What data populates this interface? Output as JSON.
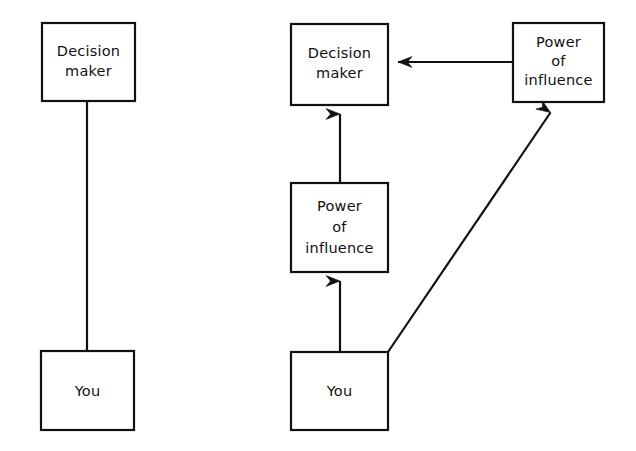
{
  "figure": {
    "background_color": "#ffffff",
    "line_color": "#111111",
    "panels": [
      {
        "id": "left-panel",
        "name": "direct-relationship-panel",
        "nodes": [
          {
            "id": "left-decision-maker",
            "label": "Decision\nmaker",
            "line1": "Decision",
            "line2": "maker",
            "x": 42,
            "y": 23,
            "w": 93,
            "h": 78
          },
          {
            "id": "left-you",
            "label": "You",
            "line1": "You",
            "x": 41,
            "y": 351,
            "w": 93,
            "h": 79
          }
        ],
        "connectors": [
          {
            "id": "left-link",
            "from": "left-decision-maker",
            "to": "left-you",
            "style": "plain-line",
            "arrowheads": 0,
            "x1": 87,
            "y1": 101,
            "x2": 87,
            "y2": 351
          }
        ]
      },
      {
        "id": "right-panel",
        "name": "power-of-influence-panel",
        "nodes": [
          {
            "id": "right-decision-maker",
            "label": "Decision\nmaker",
            "line1": "Decision",
            "line2": "maker",
            "x": 291,
            "y": 24,
            "w": 97,
            "h": 81
          },
          {
            "id": "right-power-top",
            "label": "Power\nof\ninfluence",
            "line1": "Power",
            "line2": "of",
            "line3": "influence",
            "x": 513,
            "y": 23,
            "w": 91,
            "h": 79
          },
          {
            "id": "right-power-middle",
            "label": "Power\nof\ninfluence",
            "line1": "Power",
            "line2": "of",
            "line3": "influence",
            "x": 291,
            "y": 183,
            "w": 97,
            "h": 89
          },
          {
            "id": "right-you",
            "label": "You",
            "line1": "You",
            "x": 291,
            "y": 352,
            "w": 97,
            "h": 78
          }
        ],
        "connectors": [
          {
            "id": "arrow-power-top-to-decision-maker",
            "from": "right-power-top",
            "to": "right-decision-maker",
            "style": "arrow",
            "direction": "left",
            "x1": 513,
            "y1": 62,
            "x2": 390,
            "y2": 62
          },
          {
            "id": "arrow-power-middle-to-decision-maker",
            "from": "right-power-middle",
            "to": "right-decision-maker",
            "style": "arrow",
            "direction": "up",
            "x1": 340,
            "y1": 183,
            "x2": 340,
            "y2": 106
          },
          {
            "id": "arrow-you-to-power-middle",
            "from": "right-you",
            "to": "right-power-middle",
            "style": "arrow",
            "direction": "up",
            "x1": 340,
            "y1": 352,
            "x2": 340,
            "y2": 273
          },
          {
            "id": "arrow-you-to-power-top",
            "from": "right-you",
            "to": "right-power-top",
            "style": "arrow",
            "direction": "diagonal-up-right",
            "x1": 388,
            "y1": 352,
            "x2": 557,
            "y2": 103
          }
        ]
      }
    ]
  }
}
